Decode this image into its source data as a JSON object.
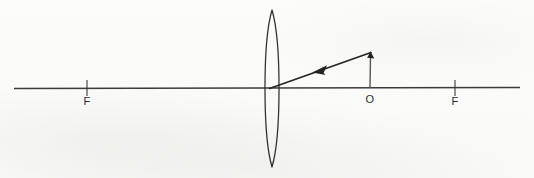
{
  "figure": {
    "background_color": "#fbfbfa",
    "ink_color": "#2f2f2f",
    "axis_color": "#3b3b3b",
    "ray_color": "#232323",
    "object_color": "#565656"
  },
  "labels": {
    "focal_left": "F",
    "focal_right": "F",
    "object_point": "O"
  },
  "elements": {
    "optical_axis": {
      "name": "optical-axis",
      "x_start": 14,
      "x_end": 520,
      "y": 88
    },
    "lens": {
      "name": "biconvex-lens",
      "center_x": 272,
      "top_y": 10,
      "bottom_y": 167,
      "half_width": 9
    },
    "focal_point_left": {
      "name": "focal-point-left",
      "x": 87,
      "tick_top_y": 80,
      "tick_bottom_y": 95,
      "label_x": 87,
      "label_y": 104
    },
    "focal_point_right": {
      "name": "focal-point-right",
      "x": 455,
      "tick_top_y": 80,
      "tick_bottom_y": 95,
      "label_x": 455,
      "label_y": 104
    },
    "object": {
      "name": "object-arrow",
      "base_x": 370,
      "base_y": 88,
      "tip_x": 370,
      "tip_y": 52,
      "label_x": 370,
      "label_y": 102
    },
    "incident_ray": {
      "name": "incident-ray",
      "from_x": 371,
      "from_y": 52,
      "to_x": 270,
      "to_y": 88,
      "arrow_x": 318,
      "arrow_y": 69,
      "direction": "toward-lens-leftward"
    }
  }
}
